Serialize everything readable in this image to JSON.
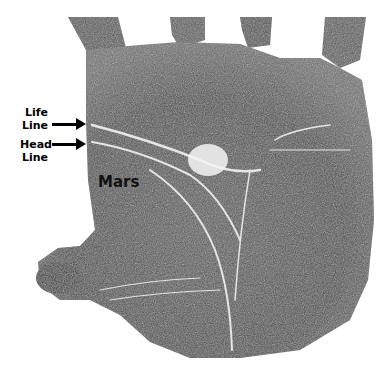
{
  "figure": {
    "labels": {
      "life_line": [
        "Life",
        "Line"
      ],
      "head_line": [
        "Head",
        "Line"
      ],
      "mount": "Mars"
    },
    "colors": {
      "background": "#ffffff",
      "print_dark": "#3a3a3a",
      "print_mid": "#6a6a6a",
      "crease": "#e8e8e8",
      "label": "#000000"
    }
  }
}
